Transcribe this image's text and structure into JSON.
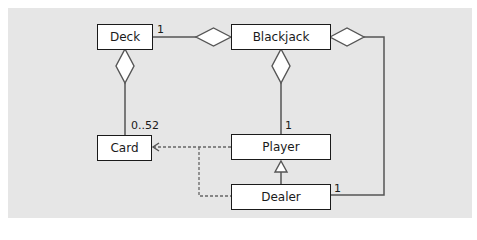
{
  "diagram": {
    "type": "uml-class-diagram",
    "colors": {
      "background": "#e6e6e6",
      "box_fill": "#ffffff",
      "stroke": "#1a1a1a",
      "line": "#555555"
    },
    "classes": [
      {
        "id": "deck",
        "name": "Deck"
      },
      {
        "id": "blackjack",
        "name": "Blackjack"
      },
      {
        "id": "card",
        "name": "Card"
      },
      {
        "id": "player",
        "name": "Player"
      },
      {
        "id": "dealer",
        "name": "Dealer"
      }
    ],
    "relationships": [
      {
        "type": "aggregation",
        "whole": "Blackjack",
        "part": "Deck",
        "multiplicity": "1"
      },
      {
        "type": "aggregation",
        "whole": "Deck",
        "part": "Card",
        "multiplicity": "0..52"
      },
      {
        "type": "aggregation",
        "whole": "Blackjack",
        "part": "Player",
        "multiplicity": "1"
      },
      {
        "type": "aggregation",
        "whole": "Blackjack",
        "part": "Dealer",
        "multiplicity": "1"
      },
      {
        "type": "generalization",
        "child": "Dealer",
        "parent": "Player"
      },
      {
        "type": "dependency",
        "from": "Player",
        "to": "Card"
      },
      {
        "type": "dependency",
        "from": "Dealer",
        "to": "Card"
      }
    ],
    "multiplicities": {
      "deck_blackjack": "1",
      "deck_card": "0..52",
      "blackjack_player": "1",
      "blackjack_dealer": "1"
    }
  }
}
